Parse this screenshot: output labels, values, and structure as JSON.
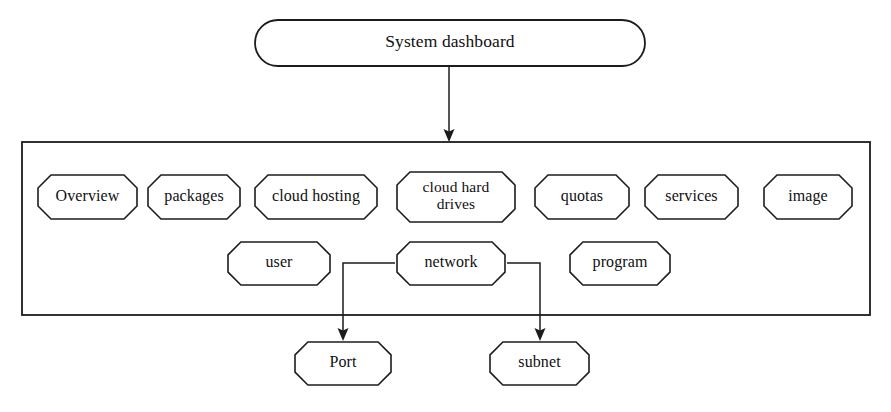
{
  "diagram": {
    "title_node": {
      "label": "System dashboard",
      "shape": "stadium",
      "x": 255,
      "y": 20,
      "w": 390,
      "h": 46
    },
    "container": {
      "name": "dashboard-modules-container",
      "x": 22,
      "y": 142,
      "w": 848,
      "h": 173
    },
    "module_row_1": [
      {
        "label": "Overview",
        "x": 38,
        "y": 175,
        "w": 99,
        "h": 44,
        "lines": [
          "Overview"
        ]
      },
      {
        "label": "packages",
        "x": 148,
        "y": 175,
        "w": 92,
        "h": 44,
        "lines": [
          "packages"
        ]
      },
      {
        "label": "cloud hosting",
        "x": 255,
        "y": 175,
        "w": 122,
        "h": 44,
        "lines": [
          "cloud hosting"
        ]
      },
      {
        "label": "cloud hard drives",
        "x": 397,
        "y": 172,
        "w": 118,
        "h": 50,
        "lines": [
          "cloud hard",
          "drives"
        ]
      },
      {
        "label": "quotas",
        "x": 535,
        "y": 175,
        "w": 94,
        "h": 44,
        "lines": [
          "quotas"
        ]
      },
      {
        "label": "services",
        "x": 645,
        "y": 175,
        "w": 93,
        "h": 44,
        "lines": [
          "services"
        ]
      },
      {
        "label": "image",
        "x": 764,
        "y": 175,
        "w": 88,
        "h": 44,
        "lines": [
          "image"
        ]
      }
    ],
    "module_row_2": [
      {
        "label": "user",
        "x": 228,
        "y": 242,
        "w": 102,
        "h": 43,
        "lines": [
          "user"
        ]
      },
      {
        "label": "network",
        "x": 397,
        "y": 242,
        "w": 108,
        "h": 43,
        "lines": [
          "network"
        ]
      },
      {
        "label": "program",
        "x": 570,
        "y": 242,
        "w": 100,
        "h": 43,
        "lines": [
          "program"
        ]
      }
    ],
    "leaf_nodes": [
      {
        "label": "Port",
        "x": 295,
        "y": 342,
        "w": 96,
        "h": 43,
        "lines": [
          "Port"
        ]
      },
      {
        "label": "subnet",
        "x": 490,
        "y": 342,
        "w": 99,
        "h": 43,
        "lines": [
          "subnet"
        ]
      }
    ],
    "connectors": [
      {
        "name": "dashboard-to-container",
        "from": "System dashboard",
        "to": "dashboard-modules-container",
        "path": "M 449 66 L 449 140",
        "arrow": {
          "x": 449,
          "y": 142
        }
      },
      {
        "name": "network-to-port",
        "from": "network",
        "to": "Port",
        "path": "M 395 263 L 343 263 L 343 338",
        "arrow": {
          "x": 343,
          "y": 341
        }
      },
      {
        "name": "network-to-subnet",
        "from": "network",
        "to": "subnet",
        "path": "M 507 263 L 540 263 L 540 338",
        "arrow": {
          "x": 540,
          "y": 341
        }
      }
    ]
  },
  "colors": {
    "stroke": "#1c1c1c",
    "fill": "#ffffff",
    "text": "#101010",
    "background": "#ffffff"
  }
}
